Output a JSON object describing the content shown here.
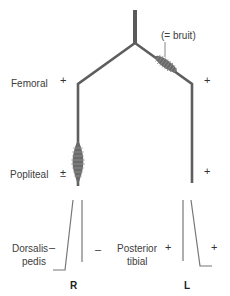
{
  "annotation": "(= bruit)",
  "labels": {
    "femoral": "Femoral",
    "popliteal": "Popliteal",
    "dorsalis_pedis_line1": "Dorsalis",
    "dorsalis_pedis_line2": "pedis",
    "posterior_tibial_line1": "Posterior",
    "posterior_tibial_line2": "tibial"
  },
  "sides": {
    "right": "R",
    "left": "L"
  },
  "pulses": {
    "right": {
      "femoral": "+",
      "popliteal": "±",
      "dorsalis_pedis": "–",
      "posterior_tibial": "–"
    },
    "left": {
      "femoral": "+",
      "popliteal": "+",
      "dorsalis_pedis": "+",
      "posterior_tibial": "+"
    }
  },
  "colors": {
    "vessel": "#5a5a5a",
    "text": "#3d3d3d"
  }
}
